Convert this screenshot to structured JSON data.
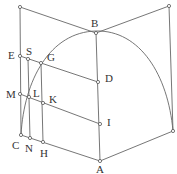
{
  "diagram": {
    "labels": {
      "B": "B",
      "E": "E",
      "S": "S",
      "G": "G",
      "D": "D",
      "M": "M",
      "L": "L",
      "K": "K",
      "I": "I",
      "C": "C",
      "N": "N",
      "H": "H",
      "A": "A"
    },
    "stroke_color": "#666666"
  }
}
